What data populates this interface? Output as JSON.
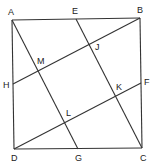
{
  "diagram": {
    "type": "geometry-square-with-inner-lines",
    "colors": {
      "line": "#333333",
      "label": "#222222",
      "background": "#ffffff"
    },
    "points": {
      "A": {
        "x": 12,
        "y": 20
      },
      "B": {
        "x": 140,
        "y": 18
      },
      "C": {
        "x": 142,
        "y": 148
      },
      "D": {
        "x": 14,
        "y": 149
      },
      "E": {
        "x": 76,
        "y": 19
      },
      "F": {
        "x": 141,
        "y": 83
      },
      "G": {
        "x": 78,
        "y": 149
      },
      "H": {
        "x": 13,
        "y": 84
      },
      "M": {
        "x": 39,
        "y": 71
      },
      "J": {
        "x": 90,
        "y": 44
      },
      "L": {
        "x": 65,
        "y": 122
      },
      "K": {
        "x": 116,
        "y": 96
      }
    },
    "segments": [
      [
        "A",
        "B"
      ],
      [
        "B",
        "C"
      ],
      [
        "C",
        "D"
      ],
      [
        "D",
        "A"
      ],
      [
        "A",
        "G"
      ],
      [
        "E",
        "C"
      ],
      [
        "H",
        "B"
      ],
      [
        "D",
        "F"
      ]
    ],
    "labels": {
      "A": "A",
      "B": "B",
      "C": "C",
      "D": "D",
      "E": "E",
      "F": "F",
      "G": "G",
      "H": "H",
      "M": "M",
      "J": "J",
      "L": "L",
      "K": "K"
    }
  }
}
